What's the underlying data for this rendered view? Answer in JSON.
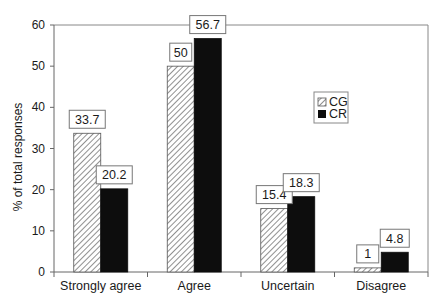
{
  "chart_data": {
    "type": "bar",
    "title": "",
    "xlabel": "",
    "ylabel": "% of total responses",
    "ylim": [
      0,
      60
    ],
    "yticks": [
      0,
      10,
      20,
      30,
      40,
      50,
      60
    ],
    "grid": false,
    "legend_position": "upper right (inside plot)",
    "categories": [
      "Strongly agree",
      "Agree",
      "Uncertain",
      "Disagree"
    ],
    "series": [
      {
        "name": "CG",
        "values": [
          33.7,
          50,
          15.4,
          1
        ],
        "labels": [
          "33.7",
          "50",
          "15.4",
          "1"
        ],
        "fill": "hatched",
        "color": "#ffffff",
        "hatch_color": "#444444"
      },
      {
        "name": "CR",
        "values": [
          20.2,
          56.7,
          18.3,
          4.8
        ],
        "labels": [
          "20.2",
          "56.7",
          "18.3",
          "4.8"
        ],
        "fill": "solid",
        "color": "#0d0d0d"
      }
    ]
  },
  "legend": {
    "items": [
      {
        "label": "CG",
        "icon": "hatched-square-icon"
      },
      {
        "label": "CR",
        "icon": "black-square-icon"
      }
    ]
  }
}
